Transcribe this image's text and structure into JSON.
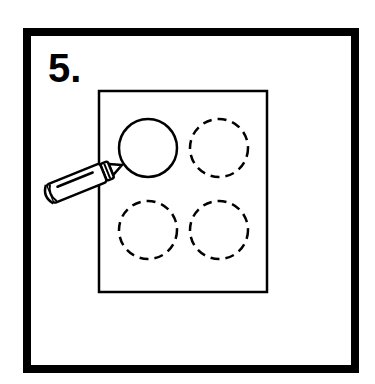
{
  "instruction_card": {
    "step_number": "5.",
    "illustration": {
      "subject": "crayon tracing dashed circles on paper",
      "paper": "rectangle sheet",
      "circles": [
        {
          "position": "top-left",
          "style": "solid",
          "state": "traced"
        },
        {
          "position": "top-right",
          "style": "dashed",
          "state": "untraced"
        },
        {
          "position": "bottom-left",
          "style": "dashed",
          "state": "untraced"
        },
        {
          "position": "bottom-right",
          "style": "dashed",
          "state": "untraced"
        }
      ],
      "tool_icon": "crayon-icon"
    },
    "colors": {
      "line": "#000000",
      "background": "#ffffff"
    }
  }
}
